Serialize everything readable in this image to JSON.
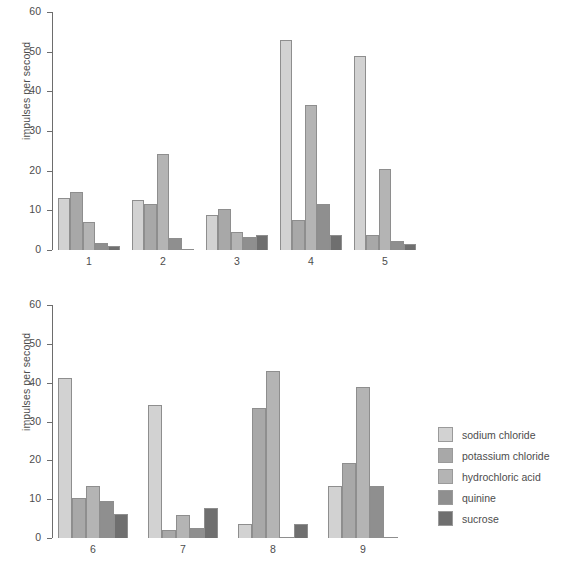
{
  "figure": {
    "ylabel": "impulses per second",
    "footnote": ""
  },
  "legend": {
    "items": [
      {
        "label": "sodium  chloride",
        "color": "#d2d2d2"
      },
      {
        "label": "potassium chloride",
        "color": "#a8a8a8"
      },
      {
        "label": "hydrochloric acid",
        "color": "#b4b4b4"
      },
      {
        "label": "quinine",
        "color": "#8f8f8f"
      },
      {
        "label": "sucrose",
        "color": "#6f6f6f"
      }
    ]
  },
  "chart_data": [
    {
      "type": "bar",
      "title": "",
      "xlabel": "",
      "ylabel": "impulses per second",
      "ylim": [
        0,
        60
      ],
      "yticks": [
        0,
        10,
        20,
        30,
        40,
        50,
        60
      ],
      "grid": false,
      "legend_position": "none",
      "categories": [
        "1",
        "2",
        "3",
        "4",
        "5"
      ],
      "series": [
        {
          "name": "sodium  chloride",
          "color": "#d2d2d2",
          "values": [
            13.0,
            12.5,
            8.7,
            53.0,
            49.0
          ]
        },
        {
          "name": "potassium chloride",
          "color": "#a8a8a8",
          "values": [
            14.5,
            11.6,
            10.4,
            7.5,
            3.7
          ]
        },
        {
          "name": "hydrochloric acid",
          "color": "#b4b4b4",
          "values": [
            7.0,
            24.2,
            4.5,
            36.5,
            20.5
          ]
        },
        {
          "name": "quinine",
          "color": "#8f8f8f",
          "values": [
            1.8,
            3.0,
            3.2,
            11.5,
            2.3
          ]
        },
        {
          "name": "sucrose",
          "color": "#6f6f6f",
          "values": [
            1.0,
            0.3,
            3.8,
            3.7,
            1.5
          ]
        }
      ]
    },
    {
      "type": "bar",
      "title": "",
      "xlabel": "",
      "ylabel": "impulses per second",
      "ylim": [
        0,
        60
      ],
      "yticks": [
        0,
        10,
        20,
        30,
        40,
        50,
        60
      ],
      "grid": false,
      "legend_position": "right",
      "categories": [
        "6",
        "7",
        "8",
        "9"
      ],
      "series": [
        {
          "name": "sodium  chloride",
          "color": "#d2d2d2",
          "values": [
            41.2,
            34.3,
            3.5,
            13.3
          ]
        },
        {
          "name": "potassium chloride",
          "color": "#a8a8a8",
          "values": [
            10.2,
            2.1,
            33.5,
            19.2
          ]
        },
        {
          "name": "hydrochloric acid",
          "color": "#b4b4b4",
          "values": [
            13.3,
            6.0,
            43.0,
            39.0
          ]
        },
        {
          "name": "quinine",
          "color": "#8f8f8f",
          "values": [
            9.5,
            2.7,
            0.3,
            13.5
          ]
        },
        {
          "name": "sucrose",
          "color": "#6f6f6f",
          "values": [
            6.1,
            7.7,
            3.5,
            0.3
          ]
        }
      ]
    }
  ]
}
